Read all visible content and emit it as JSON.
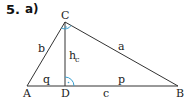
{
  "problem": {
    "number": "5.",
    "part": "a)"
  },
  "figure": {
    "vertices": [
      {
        "name": "A",
        "x": 27,
        "y": 86
      },
      {
        "name": "B",
        "x": 178,
        "y": 86
      },
      {
        "name": "C",
        "x": 65,
        "y": 22
      },
      {
        "name": "D",
        "x": 65,
        "y": 86
      }
    ],
    "labels": {
      "A": "A",
      "B": "B",
      "C": "C",
      "D": "D",
      "a": "a",
      "b": "b",
      "c": "c",
      "p": "p",
      "q": "q",
      "h": "h",
      "h_sub": "c"
    },
    "colors": {
      "lines": "#333333",
      "angle_marks": "#3a9fd0"
    }
  }
}
